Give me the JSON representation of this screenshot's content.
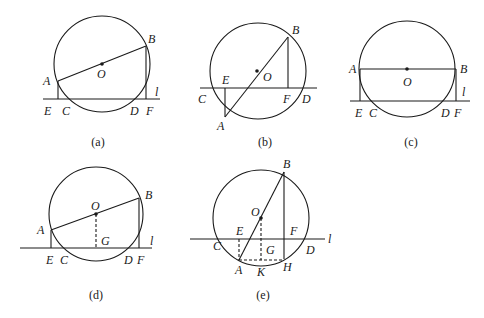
{
  "figures": [
    {
      "id": "a",
      "caption": "(a)",
      "caption_pos": [
        98,
        146
      ],
      "circle": {
        "cx": 102,
        "cy": 64,
        "r": 48
      },
      "center_dot": [
        102,
        64
      ],
      "lines": [
        {
          "x1": 43,
          "y1": 99,
          "x2": 160,
          "y2": 99,
          "name": "line-l"
        },
        {
          "x1": 58,
          "y1": 81,
          "x2": 146,
          "y2": 46,
          "name": "segment-AB"
        },
        {
          "x1": 58,
          "y1": 81,
          "x2": 58,
          "y2": 99,
          "name": "segment-AE"
        },
        {
          "x1": 146,
          "y1": 46,
          "x2": 146,
          "y2": 99,
          "name": "segment-BF"
        }
      ],
      "dashed": [],
      "labels": [
        {
          "t": "A",
          "x": 43,
          "y": 85
        },
        {
          "t": "B",
          "x": 148,
          "y": 43
        },
        {
          "t": "O",
          "x": 97,
          "y": 78
        },
        {
          "t": "l",
          "x": 155,
          "y": 96
        },
        {
          "t": "E",
          "x": 44,
          "y": 115
        },
        {
          "t": "C",
          "x": 62,
          "y": 115
        },
        {
          "t": "D",
          "x": 130,
          "y": 115
        },
        {
          "t": "F",
          "x": 146,
          "y": 115
        }
      ]
    },
    {
      "id": "b",
      "caption": "(b)",
      "caption_pos": [
        265,
        146
      ],
      "circle": {
        "cx": 258,
        "cy": 71,
        "r": 48
      },
      "center_dot": [
        257,
        71
      ],
      "lines": [
        {
          "x1": 200,
          "y1": 88,
          "x2": 317,
          "y2": 88,
          "name": "line-l"
        },
        {
          "x1": 225,
          "y1": 117,
          "x2": 288,
          "y2": 37,
          "name": "segment-AB"
        },
        {
          "x1": 225,
          "y1": 117,
          "x2": 225,
          "y2": 88,
          "name": "segment-AE"
        },
        {
          "x1": 288,
          "y1": 37,
          "x2": 288,
          "y2": 88,
          "name": "segment-BF"
        }
      ],
      "dashed": [],
      "labels": [
        {
          "t": "A",
          "x": 217,
          "y": 130
        },
        {
          "t": "B",
          "x": 292,
          "y": 34
        },
        {
          "t": "O",
          "x": 263,
          "y": 81
        },
        {
          "t": "E",
          "x": 222,
          "y": 84
        },
        {
          "t": "C",
          "x": 198,
          "y": 103
        },
        {
          "t": "F",
          "x": 283,
          "y": 103
        },
        {
          "t": "D",
          "x": 302,
          "y": 103
        }
      ]
    },
    {
      "id": "c",
      "caption": "(c)",
      "caption_pos": [
        411,
        146
      ],
      "circle": {
        "cx": 407,
        "cy": 69,
        "r": 48
      },
      "center_dot": [
        407,
        69
      ],
      "lines": [
        {
          "x1": 350,
          "y1": 101,
          "x2": 470,
          "y2": 101,
          "name": "line-l"
        },
        {
          "x1": 360,
          "y1": 69,
          "x2": 456,
          "y2": 69,
          "name": "segment-AB"
        },
        {
          "x1": 360,
          "y1": 69,
          "x2": 360,
          "y2": 101,
          "name": "segment-AE"
        },
        {
          "x1": 456,
          "y1": 69,
          "x2": 456,
          "y2": 101,
          "name": "segment-BF"
        }
      ],
      "dashed": [],
      "labels": [
        {
          "t": "A",
          "x": 349,
          "y": 73
        },
        {
          "t": "B",
          "x": 460,
          "y": 73
        },
        {
          "t": "O",
          "x": 403,
          "y": 86
        },
        {
          "t": "l",
          "x": 462,
          "y": 96
        },
        {
          "t": "E",
          "x": 355,
          "y": 117
        },
        {
          "t": "C",
          "x": 369,
          "y": 117
        },
        {
          "t": "D",
          "x": 441,
          "y": 117
        },
        {
          "t": "F",
          "x": 454,
          "y": 117
        }
      ]
    },
    {
      "id": "d",
      "caption": "(d)",
      "caption_pos": [
        96,
        299
      ],
      "circle": {
        "cx": 96,
        "cy": 214,
        "r": 47
      },
      "center_dot": [
        96,
        214
      ],
      "lines": [
        {
          "x1": 20,
          "y1": 248,
          "x2": 152,
          "y2": 248,
          "name": "line-l"
        },
        {
          "x1": 51,
          "y1": 230,
          "x2": 139,
          "y2": 198,
          "name": "segment-AB"
        },
        {
          "x1": 51,
          "y1": 230,
          "x2": 51,
          "y2": 248,
          "name": "segment-AE"
        },
        {
          "x1": 139,
          "y1": 198,
          "x2": 139,
          "y2": 248,
          "name": "segment-BF"
        }
      ],
      "dashed": [
        {
          "x1": 96,
          "y1": 214,
          "x2": 96,
          "y2": 248,
          "name": "segment-OG"
        }
      ],
      "labels": [
        {
          "t": "A",
          "x": 37,
          "y": 234
        },
        {
          "t": "B",
          "x": 145,
          "y": 199
        },
        {
          "t": "O",
          "x": 91,
          "y": 210
        },
        {
          "t": "G",
          "x": 101,
          "y": 245
        },
        {
          "t": "l",
          "x": 150,
          "y": 245
        },
        {
          "t": "E",
          "x": 46,
          "y": 264
        },
        {
          "t": "C",
          "x": 60,
          "y": 264
        },
        {
          "t": "D",
          "x": 124,
          "y": 264
        },
        {
          "t": "F",
          "x": 137,
          "y": 264
        }
      ]
    },
    {
      "id": "e",
      "caption": "(e)",
      "caption_pos": [
        263,
        299
      ],
      "circle": {
        "cx": 261,
        "cy": 218,
        "r": 48
      },
      "center_dot": [
        261,
        218
      ],
      "lines": [
        {
          "x1": 190,
          "y1": 239,
          "x2": 325,
          "y2": 239,
          "name": "line-l"
        },
        {
          "x1": 239,
          "y1": 260,
          "x2": 284,
          "y2": 172,
          "name": "segment-AB"
        },
        {
          "x1": 284,
          "y1": 172,
          "x2": 284,
          "y2": 259,
          "name": "segment-BH"
        }
      ],
      "dashed": [
        {
          "x1": 239,
          "y1": 239,
          "x2": 239,
          "y2": 260,
          "name": "segment-EA"
        },
        {
          "x1": 261,
          "y1": 218,
          "x2": 261,
          "y2": 260,
          "name": "segment-OK"
        },
        {
          "x1": 239,
          "y1": 260,
          "x2": 284,
          "y2": 260,
          "name": "segment-AH"
        }
      ],
      "labels": [
        {
          "t": "B",
          "x": 283,
          "y": 168
        },
        {
          "t": "O",
          "x": 251,
          "y": 216
        },
        {
          "t": "E",
          "x": 236,
          "y": 235
        },
        {
          "t": "F",
          "x": 290,
          "y": 235
        },
        {
          "t": "l",
          "x": 328,
          "y": 243
        },
        {
          "t": "C",
          "x": 213,
          "y": 250
        },
        {
          "t": "G",
          "x": 266,
          "y": 254
        },
        {
          "t": "D",
          "x": 306,
          "y": 254
        },
        {
          "t": "A",
          "x": 235,
          "y": 274
        },
        {
          "t": "K",
          "x": 257,
          "y": 276
        },
        {
          "t": "H",
          "x": 283,
          "y": 271
        }
      ]
    }
  ]
}
